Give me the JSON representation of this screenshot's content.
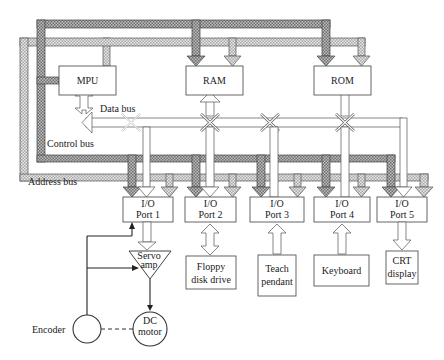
{
  "diagram": {
    "type": "computer-architecture-block-diagram",
    "buses": {
      "data": "Data bus",
      "control": "Control bus",
      "address": "Address bus"
    },
    "core": {
      "mpu": "MPU",
      "ram": "RAM",
      "rom": "ROM"
    },
    "ports": [
      {
        "line1": "I/O",
        "line2": "Port 1"
      },
      {
        "line1": "I/O",
        "line2": "Port 2"
      },
      {
        "line1": "I/O",
        "line2": "Port 3"
      },
      {
        "line1": "I/O",
        "line2": "Port 4"
      },
      {
        "line1": "I/O",
        "line2": "Port 5"
      }
    ],
    "devices": {
      "servo_amp": {
        "line1": "Servo",
        "line2": "amp"
      },
      "floppy": {
        "line1": "Floppy",
        "line2": "disk drive"
      },
      "teach_pendant": {
        "line1": "Teach",
        "line2": "pendant"
      },
      "keyboard": "Keyboard",
      "crt": {
        "line1": "CRT",
        "line2": "display"
      },
      "dc_motor": {
        "line1": "DC",
        "line2": "motor"
      },
      "encoder": "Encoder"
    },
    "colors": {
      "control_bus": "#8c8c8c",
      "address_bus": "#c8c8c8",
      "data_bus": "#ffffff",
      "outline": "#555555"
    }
  }
}
